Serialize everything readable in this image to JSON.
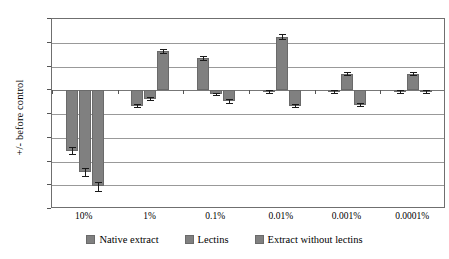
{
  "chart_data": {
    "type": "bar",
    "title": "",
    "xlabel": "",
    "ylabel": "+/- before control",
    "ylim": [
      -100,
      60
    ],
    "yticks": [
      60,
      40,
      20,
      0,
      -20,
      -40,
      -60,
      -80,
      -100
    ],
    "ytick_labels": [
      "60",
      "40",
      "20",
      "0",
      "-20",
      "-40",
      "-60",
      "-80",
      "-100"
    ],
    "grid": true,
    "legend_position": "bottom",
    "categories": [
      "10%",
      "1%",
      "0.1%",
      "0.01%",
      "0.001%",
      "0.0001%"
    ],
    "series": [
      {
        "name": "Native extract",
        "values": [
          -51,
          -13,
          27,
          -1,
          -1,
          -1
        ],
        "errors": [
          3,
          1.5,
          1.5,
          1,
          1,
          1
        ]
      },
      {
        "name": "Lectins",
        "values": [
          -69,
          -7,
          -3,
          45,
          14,
          14
        ],
        "errors": [
          3.5,
          1,
          1,
          2,
          1.5,
          1.5
        ]
      },
      {
        "name": "Extract without lectins",
        "values": [
          -81,
          33,
          -9,
          -13,
          -12,
          -1
        ],
        "errors": [
          4,
          2,
          1.5,
          1.5,
          1.5,
          1
        ]
      }
    ]
  },
  "legend": {
    "items": [
      {
        "label": "Native extract",
        "swatch": "legend-swatch-native-extract"
      },
      {
        "label": "Lectins",
        "swatch": "legend-swatch-lectins"
      },
      {
        "label": "Extract without lectins",
        "swatch": "legend-swatch-extract-without-lectins"
      }
    ]
  },
  "colors": {
    "bar": "#808080",
    "bar_border": "#6a6a6a",
    "gridline": "#999999",
    "axis": "#6f6f6f",
    "error": "#1a1a1a",
    "background": "#ffffff"
  }
}
